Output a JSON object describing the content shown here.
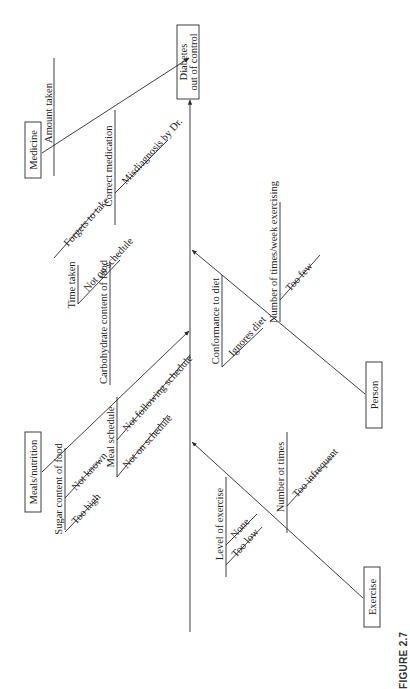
{
  "figure": {
    "caption": "FIGURE 2.7",
    "type": "Cause-and-effect (fishbone) diagram, rotated 90° counter-clockwise"
  },
  "effect": {
    "line1": "Diabetes",
    "line2": "out of control"
  },
  "categories": {
    "medicine": {
      "label": "Medicine",
      "causes": {
        "amount_taken": {
          "label": "Amount taken",
          "sub": [
            "Forgets to take"
          ]
        },
        "correct_medication": {
          "label": "Correct medication",
          "sub": [
            "Misdiagnosis by Dr."
          ]
        },
        "time_taken": {
          "label": "Time taken",
          "sub": [
            "Not on schedule"
          ]
        }
      }
    },
    "meals": {
      "label": "Meals/nutrition",
      "causes": {
        "sugar_content": {
          "label": "Sugar content of food",
          "sub": [
            "Not known",
            "Too high"
          ]
        },
        "meal_schedule": {
          "label": "Meal schedule",
          "sub": [
            "Not following schedule",
            "Not on schedule"
          ]
        },
        "carb_content": {
          "label": "Carbohydrate content of food",
          "sub": []
        }
      }
    },
    "person": {
      "label": "Person",
      "causes": {
        "conformance": {
          "label": "Conformance to diet",
          "sub": [
            "Ignores diet"
          ]
        },
        "times_week": {
          "label": "Number of times/week exercising",
          "sub": [
            "Too few"
          ]
        }
      }
    },
    "exercise": {
      "label": "Exercise",
      "causes": {
        "level": {
          "label": "Level of exercise",
          "sub": [
            "None",
            "Too low"
          ]
        },
        "number_times": {
          "label": "Number ot times",
          "sub": [
            "Too infrequent"
          ]
        }
      }
    }
  },
  "colors": {
    "line": "#2a2a2a",
    "text": "#222222",
    "background": "#ffffff"
  }
}
